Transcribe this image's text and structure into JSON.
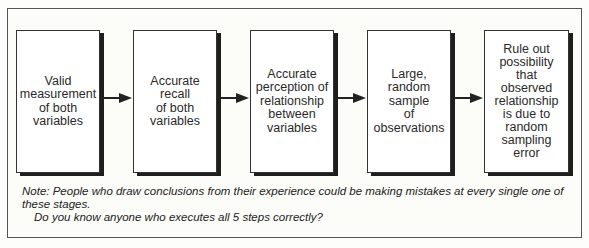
{
  "diagram": {
    "type": "flow",
    "steps": [
      {
        "label": "Valid\nmeasurement\nof both\nvariables"
      },
      {
        "label": "Accurate\nrecall\nof both\nvariables"
      },
      {
        "label": "Accurate\nperception of\nrelationship\nbetween\nvariables"
      },
      {
        "label": "Large,\nrandom\nsample\nof\nobservations"
      },
      {
        "label": "Rule out\npossibility\nthat\nobserved\nrelationship\nis due to\nrandom\nsampling\nerror"
      }
    ],
    "note": {
      "line1": "Note: People who draw conclusions from their experience could be making mistakes at every single one of these stages.",
      "line2": "Do you know anyone who executes all 5 steps correctly?"
    }
  }
}
